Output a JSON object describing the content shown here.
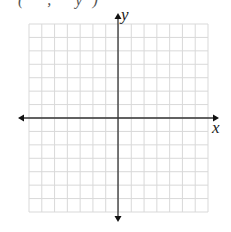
{
  "figure": {
    "type": "coordinate_plane",
    "clipped_text": "( ,  y)",
    "x_axis_label": "x",
    "y_axis_label": "y",
    "grid": {
      "columns": 14,
      "rows": 14,
      "left": 29,
      "top": 24,
      "right": 208,
      "bottom": 212,
      "line_color": "#d9d9d9"
    },
    "axes": {
      "origin_x": 118,
      "origin_y": 118,
      "x_start": 18,
      "x_end": 219,
      "y_start": 13,
      "y_end": 222,
      "color": "#333333"
    }
  }
}
